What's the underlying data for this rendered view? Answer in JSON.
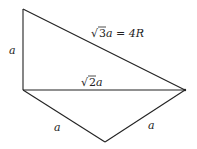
{
  "diagram": {
    "vertices": {
      "top": [
        23,
        9
      ],
      "left": [
        23,
        90
      ],
      "right": [
        185,
        90
      ],
      "bottom": [
        105,
        142
      ]
    },
    "edges": [
      {
        "from": "top",
        "to": "left",
        "label": "a"
      },
      {
        "from": "top",
        "to": "right",
        "label": "√3a = 4R"
      },
      {
        "from": "left",
        "to": "right",
        "label": "√2a"
      },
      {
        "from": "left",
        "to": "bottom",
        "label": "a"
      },
      {
        "from": "bottom",
        "to": "right",
        "label": "a"
      }
    ],
    "labels": {
      "left_edge": "a",
      "hypotenuse_sqrt": "√",
      "hypotenuse_num": "3",
      "hypotenuse_rest": "a = 4R",
      "middle_sqrt": "√",
      "middle_num": "2",
      "middle_rest": "a",
      "bottom_left": "a",
      "bottom_right": "a"
    },
    "colors": {
      "stroke": "#222222",
      "background": "#ffffff"
    }
  }
}
